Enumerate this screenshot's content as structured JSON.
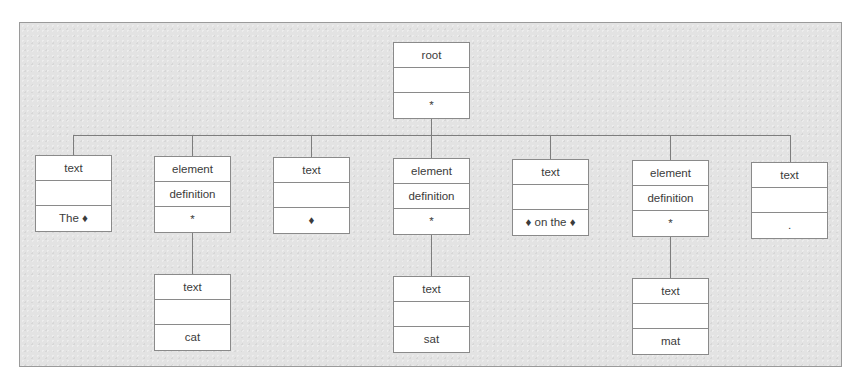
{
  "diagram": {
    "type": "tree",
    "separator_glyph": "♦",
    "root": {
      "row1": "root",
      "row2": "",
      "row3": "*"
    },
    "children": [
      {
        "row1": "text",
        "row2": "",
        "row3": "The ♦"
      },
      {
        "row1": "element",
        "row2": "definition",
        "row3": "*",
        "child": {
          "row1": "text",
          "row2": "",
          "row3": "cat"
        }
      },
      {
        "row1": "text",
        "row2": "",
        "row3": "♦"
      },
      {
        "row1": "element",
        "row2": "definition",
        "row3": "*",
        "child": {
          "row1": "text",
          "row2": "",
          "row3": "sat"
        }
      },
      {
        "row1": "text",
        "row2": "",
        "row3": "♦ on the ♦"
      },
      {
        "row1": "element",
        "row2": "definition",
        "row3": "*",
        "child": {
          "row1": "text",
          "row2": "",
          "row3": "mat"
        }
      },
      {
        "row1": "text",
        "row2": "",
        "row3": "."
      }
    ],
    "colors": {
      "panel_background": "#e3e3e3",
      "panel_border": "#9a9a9a",
      "node_background": "#ffffff",
      "node_border": "#8a8a8a",
      "connector": "#7d7d7d",
      "text": "#3b3b3b"
    }
  }
}
